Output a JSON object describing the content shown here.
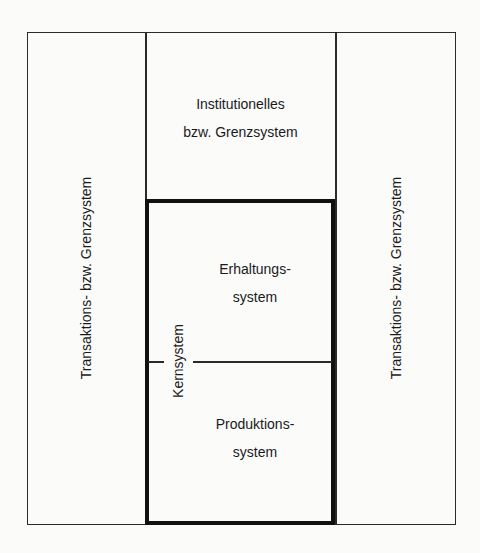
{
  "diagram": {
    "title": "",
    "boxes": {
      "institutional": {
        "line1": "Institutionelles",
        "line2": "bzw. Grenzsystem"
      },
      "left_column": {
        "label": "Transaktions- bzw. Grenzsystem"
      },
      "right_column": {
        "label": "Transaktions- bzw. Grenzsystem"
      },
      "core": {
        "label": "Kernsystem",
        "upper": {
          "line1": "Erhaltungs-",
          "line2": "system"
        },
        "lower": {
          "line1": "Produktions-",
          "line2": "system"
        }
      }
    },
    "colors": {
      "line": "#2a2a2a",
      "core_border": "#111111",
      "background": "#fbfbfa"
    }
  }
}
